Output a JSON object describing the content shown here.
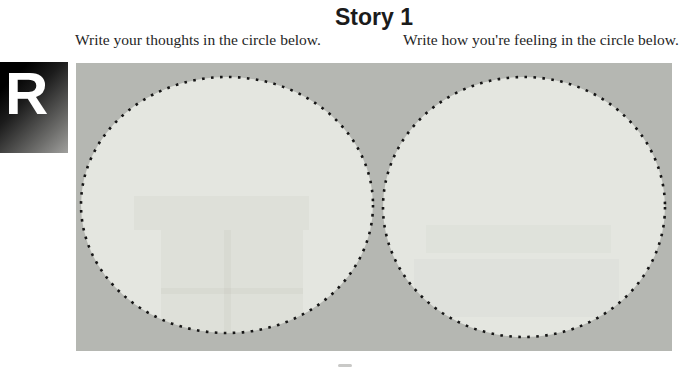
{
  "header": {
    "title": "Story 1"
  },
  "badge": {
    "letter": "R"
  },
  "instructions": {
    "left": "Write your thoughts in the circle below.",
    "right": "Write how you're feeling in the circle below."
  },
  "worksheet": {
    "left_circle_purpose": "thoughts writing area",
    "right_circle_purpose": "feelings writing area"
  },
  "colors": {
    "panel_bg": "#b5b7b2",
    "circle_fill": "#e4e6e0",
    "dot": "#161616",
    "badge_dark": "#000000",
    "badge_light": "#a0a09e",
    "text": "#1c1c1c"
  }
}
